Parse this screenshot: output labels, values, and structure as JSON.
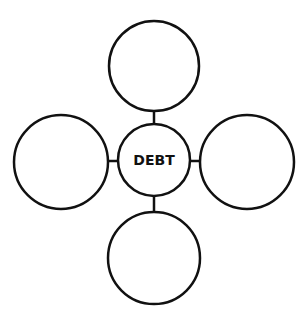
{
  "diagram": {
    "type": "concept-web",
    "center": {
      "label": "DEBT",
      "cx": 154,
      "cy": 160,
      "r": 36
    },
    "nodes": [
      {
        "id": "top",
        "label": "",
        "cx": 154,
        "cy": 66,
        "r": 45
      },
      {
        "id": "left",
        "label": "",
        "cx": 61,
        "cy": 162,
        "r": 47
      },
      {
        "id": "right",
        "label": "",
        "cx": 247,
        "cy": 162,
        "r": 47
      },
      {
        "id": "bottom",
        "label": "",
        "cx": 154,
        "cy": 258,
        "r": 46
      }
    ],
    "stroke_color": "#111111",
    "fill_color": "#ffffff"
  }
}
